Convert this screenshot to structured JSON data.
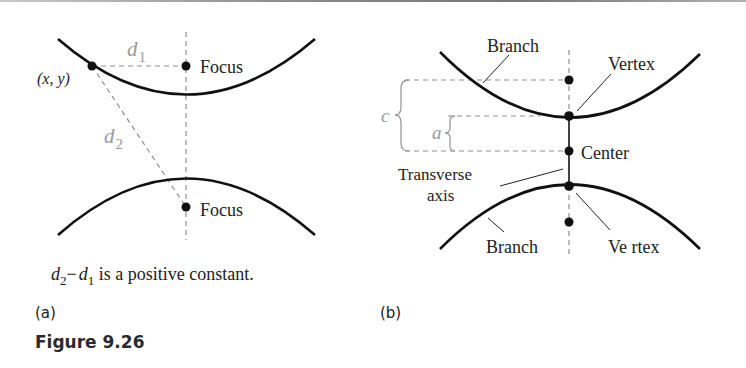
{
  "figure": {
    "title": "Figure 9.26",
    "colors": {
      "curve": "#111111",
      "dashed": "#8f8f8f",
      "gray_label": "#9a9a9a",
      "text": "#222222"
    }
  },
  "panel_a": {
    "label": "(a)",
    "point_label": "(x, y)",
    "d1_label": "d",
    "d1_sub": "1",
    "d2_label": "d",
    "d2_sub": "2",
    "focus_top_label": "Focus",
    "focus_bottom_label": "Focus",
    "caption": {
      "d2": "d",
      "d2_sub": "2",
      "minus": "−",
      "d1": "d",
      "d1_sub": "1",
      "rest": " is a positive constant."
    }
  },
  "panel_b": {
    "label": "(b)",
    "branch_top_label": "Branch",
    "vertex_top_label": "Vertex",
    "c_label": "c",
    "a_label": "a",
    "center_label": "Center",
    "transverse_label_line1": "Transverse",
    "transverse_label_line2": "axis",
    "branch_bottom_label": "Branch",
    "vertex_bottom_label": "Ve rtex"
  }
}
